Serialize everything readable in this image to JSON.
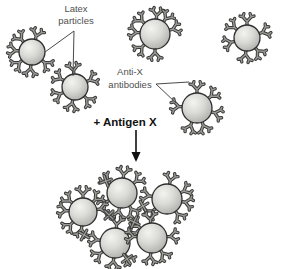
{
  "diagram": {
    "labels": {
      "latex": {
        "line1": "Latex",
        "line2": "particles",
        "x": 76,
        "y1": 12,
        "y2": 23.5
      },
      "anti_x": {
        "line1": "Anti-X",
        "line2": "antibodies",
        "x": 130,
        "y1": 75,
        "y2": 87.5
      },
      "antigen": {
        "text": "+ Antigen X",
        "x": 125,
        "y": 126
      }
    },
    "colors": {
      "background": "#ffffff",
      "sphere_highlight": "#f3f3f1",
      "sphere_mid": "#dadad6",
      "sphere_shadow": "#a9a9a5",
      "outline": "#2e2e2e",
      "antibody_outline": "#3a3a3a",
      "antibody_core": "#9c9c96",
      "label_text": "#4f4f4f",
      "line": "#4a4a4a",
      "arrow": "#111111",
      "antigen_text": "#111111"
    },
    "free_particles": [
      {
        "cx": 32,
        "cy": 52,
        "r": 13,
        "ab": [
          -75,
          -130,
          185,
          140,
          95,
          40
        ]
      },
      {
        "cx": 75,
        "cy": 87,
        "r": 13,
        "ab": [
          -95,
          -150,
          -25,
          45,
          100,
          155
        ]
      },
      {
        "cx": 155,
        "cy": 34,
        "r": 15,
        "ab": [
          -85,
          -135,
          185,
          135,
          90,
          -15,
          -55
        ]
      },
      {
        "cx": 247,
        "cy": 38,
        "r": 13,
        "ab": [
          -90,
          -140,
          -20,
          50,
          95,
          165
        ]
      },
      {
        "cx": 197,
        "cy": 108,
        "r": 15,
        "ab": [
          -90,
          -40,
          15,
          70,
          110,
          185
        ]
      }
    ],
    "cluster_particles": [
      {
        "cx": 122,
        "cy": 193,
        "r": 15,
        "ab": [
          -85,
          -140,
          -40,
          60,
          100,
          150
        ]
      },
      {
        "cx": 167,
        "cy": 199,
        "r": 15,
        "ab": [
          -80,
          -25,
          10,
          55,
          140,
          190
        ]
      },
      {
        "cx": 83,
        "cy": 212,
        "r": 14,
        "ab": [
          -90,
          -140,
          185,
          135,
          95,
          -10,
          -45
        ]
      },
      {
        "cx": 115,
        "cy": 243,
        "r": 15,
        "ab": [
          -85,
          -35,
          50,
          95,
          145,
          190
        ]
      },
      {
        "cx": 152,
        "cy": 238,
        "r": 15,
        "ab": [
          -95,
          -140,
          -5,
          55,
          95,
          185
        ]
      }
    ],
    "antigens": [
      {
        "x": 106,
        "y": 181,
        "rot": 25
      },
      {
        "x": 143,
        "y": 206,
        "rot": 15
      },
      {
        "x": 109,
        "y": 215,
        "rot": 0
      },
      {
        "x": 134,
        "y": 222,
        "rot": -20
      },
      {
        "x": 84,
        "y": 235,
        "rot": -15
      },
      {
        "x": 127,
        "y": 259,
        "rot": 10
      }
    ],
    "leaders": {
      "latex": {
        "vertex": [
          74,
          31
        ],
        "targets": [
          [
            45,
            52
          ],
          [
            73,
            76
          ]
        ]
      },
      "anti_x": {
        "vertex": [
          156,
          84
        ],
        "targets": [
          [
            189,
            82
          ],
          [
            176,
            103
          ]
        ]
      }
    },
    "arrow": {
      "x": 136,
      "y1": 130,
      "y2": 153,
      "tip": 162
    }
  }
}
